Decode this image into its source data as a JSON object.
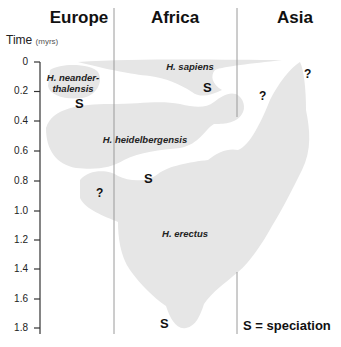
{
  "regions": [
    "Europe",
    "Africa",
    "Asia"
  ],
  "axis": {
    "title": "Time",
    "unit": "(myrs)",
    "ticks": [
      "0",
      "0.2",
      "0.4",
      "0.6",
      "0.8",
      "1.0",
      "1.2",
      "1.4",
      "1.6",
      "1.8"
    ]
  },
  "species": {
    "neanderthalensis": "H. neander-",
    "neanderthalensis_2": "thalensis",
    "sapiens": "H. sapiens",
    "heidelbergensis": "H. heidelbergensis",
    "erectus": "H. erectus"
  },
  "markers": {
    "speciation": "S",
    "unknown": "?"
  },
  "legend": "S = speciation",
  "colors": {
    "blob": "#e8e8e8",
    "axis": "#333333",
    "divider": "#999999"
  }
}
